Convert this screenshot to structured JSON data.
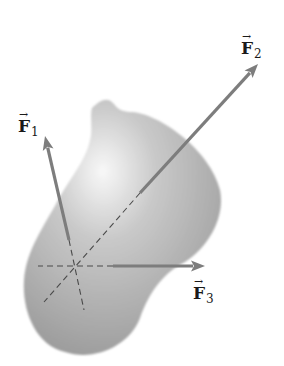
{
  "figure": {
    "body": {
      "fill_light": "#f8f8f8",
      "fill_mid": "#c9c9c9",
      "fill_dark": "#9a9a9a",
      "path": "M 92 108 C 100 100, 108 96, 114 104 C 118 110, 124 112, 132 112 C 160 114, 210 150, 220 190 C 226 220, 205 250, 185 262 C 165 272, 150 290, 140 318 C 130 345, 95 362, 65 352 C 35 345, 22 310, 24 280 C 26 250, 45 225, 58 200 C 72 175, 88 158, 91 135 C 92 125, 90 115, 92 108 Z"
    },
    "intersection": {
      "x": 73,
      "y": 266
    },
    "arrow_color": "#7d7d7d",
    "dash_color": "#4a4a4a",
    "forces": [
      {
        "id": "F1",
        "symbol": "F",
        "subscript": "1",
        "arrow_over": "→",
        "shaft_start": {
          "x": 69,
          "y": 240
        },
        "tip": {
          "x": 45,
          "y": 136
        },
        "dash_from": {
          "x": 69,
          "y": 240
        },
        "dash_to": {
          "x": 84,
          "y": 310
        },
        "label_pos": {
          "x": 18,
          "y": 118
        }
      },
      {
        "id": "F2",
        "symbol": "F",
        "subscript": "2",
        "arrow_over": "→",
        "shaft_start": {
          "x": 140,
          "y": 193
        },
        "tip": {
          "x": 258,
          "y": 64
        },
        "dash_from": {
          "x": 140,
          "y": 193
        },
        "dash_to": {
          "x": 44,
          "y": 302
        },
        "label_pos": {
          "x": 241,
          "y": 40
        }
      },
      {
        "id": "F3",
        "symbol": "F",
        "subscript": "3",
        "arrow_over": "→",
        "shaft_start": {
          "x": 113,
          "y": 266
        },
        "tip": {
          "x": 205,
          "y": 266
        },
        "dash_from": {
          "x": 113,
          "y": 266
        },
        "dash_to": {
          "x": 38,
          "y": 266
        },
        "label_pos": {
          "x": 193,
          "y": 285
        }
      }
    ]
  }
}
